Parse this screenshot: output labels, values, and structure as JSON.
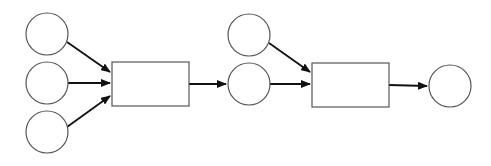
{
  "diagram": {
    "type": "petri-net",
    "colors": {
      "node_stroke": "#555555",
      "arc": "#111111",
      "background": "#ffffff"
    },
    "places": [
      {
        "id": "p1",
        "cx": 47,
        "cy": 34,
        "r": 21
      },
      {
        "id": "p2",
        "cx": 47,
        "cy": 83,
        "r": 21
      },
      {
        "id": "p3",
        "cx": 47,
        "cy": 132,
        "r": 21
      },
      {
        "id": "p4",
        "cx": 249,
        "cy": 35,
        "r": 21
      },
      {
        "id": "p5",
        "cx": 249,
        "cy": 84,
        "r": 21
      },
      {
        "id": "p6",
        "cx": 450,
        "cy": 86,
        "r": 21
      }
    ],
    "transitions": [
      {
        "id": "t1",
        "x": 112,
        "y": 62,
        "w": 77,
        "h": 44
      },
      {
        "id": "t2",
        "x": 312,
        "y": 63,
        "w": 77,
        "h": 44
      }
    ],
    "arcs": [
      {
        "from": "p1",
        "to": "t1",
        "x1": 67,
        "y1": 42,
        "x2": 110,
        "y2": 72
      },
      {
        "from": "p2",
        "to": "t1",
        "x1": 68,
        "y1": 83,
        "x2": 110,
        "y2": 83
      },
      {
        "from": "p3",
        "to": "t1",
        "x1": 67,
        "y1": 127,
        "x2": 110,
        "y2": 96
      },
      {
        "from": "t1",
        "to": "p5",
        "x1": 189,
        "y1": 84,
        "x2": 226,
        "y2": 84
      },
      {
        "from": "p4",
        "to": "t2",
        "x1": 269,
        "y1": 43,
        "x2": 310,
        "y2": 72
      },
      {
        "from": "p5",
        "to": "t2",
        "x1": 270,
        "y1": 84,
        "x2": 310,
        "y2": 84
      },
      {
        "from": "t2",
        "to": "p6",
        "x1": 389,
        "y1": 85,
        "x2": 427,
        "y2": 86
      }
    ]
  }
}
